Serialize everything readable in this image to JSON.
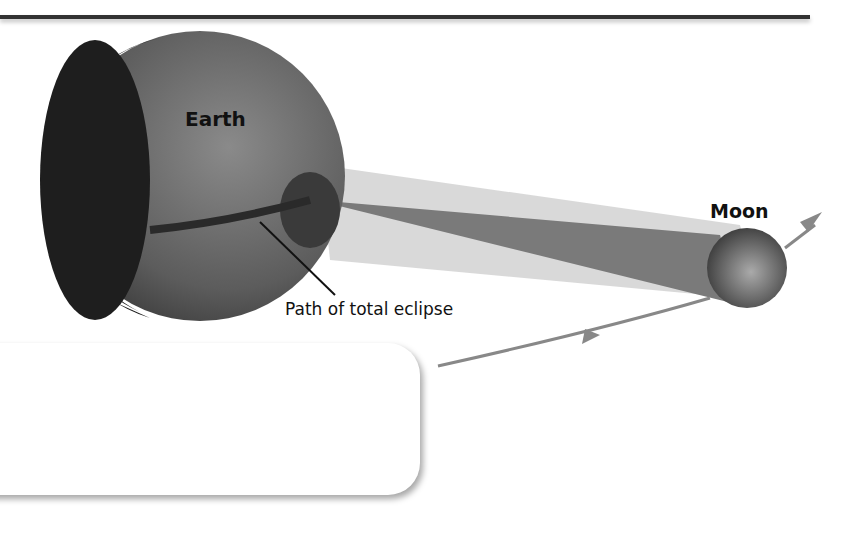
{
  "diagram": {
    "labels": {
      "earth": "Earth",
      "moon": "Moon",
      "path": "Path of total eclipse"
    },
    "colors": {
      "rule": "#333333",
      "umbra": "#7a7a7a",
      "penumbra": "#c8c8c8",
      "orbit": "#888888",
      "earth_day": "#6a6a6a",
      "earth_night": "#1e1e1e",
      "sun": "#dcdcdc"
    },
    "elements": [
      "Earth",
      "Moon",
      "Sun",
      "Shadow cone (umbra)",
      "Penumbra",
      "Moon orbit arrows",
      "Sunlight arrows"
    ]
  }
}
